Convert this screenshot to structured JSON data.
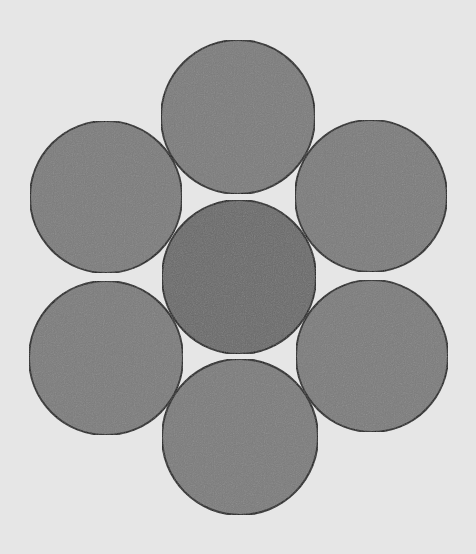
{
  "diagram": {
    "width": 476,
    "height": 554,
    "background": "#e6e6e6",
    "stroke": "#1e1e1e",
    "stroke_width": 2,
    "circles": [
      {
        "id": "top",
        "cx": 238,
        "cy": 117,
        "r": 77,
        "fill": "#7b7b7b"
      },
      {
        "id": "upper-left",
        "cx": 106,
        "cy": 197,
        "r": 76,
        "fill": "#7b7b7b"
      },
      {
        "id": "upper-right",
        "cx": 371,
        "cy": 196,
        "r": 76,
        "fill": "#7b7b7b"
      },
      {
        "id": "center",
        "cx": 239,
        "cy": 277,
        "r": 77,
        "fill": "#6b6b6b"
      },
      {
        "id": "lower-left",
        "cx": 106,
        "cy": 358,
        "r": 77,
        "fill": "#7b7b7b"
      },
      {
        "id": "lower-right",
        "cx": 372,
        "cy": 356,
        "r": 76,
        "fill": "#7b7b7b"
      },
      {
        "id": "bottom",
        "cx": 240,
        "cy": 437,
        "r": 78,
        "fill": "#7b7b7b"
      }
    ]
  }
}
